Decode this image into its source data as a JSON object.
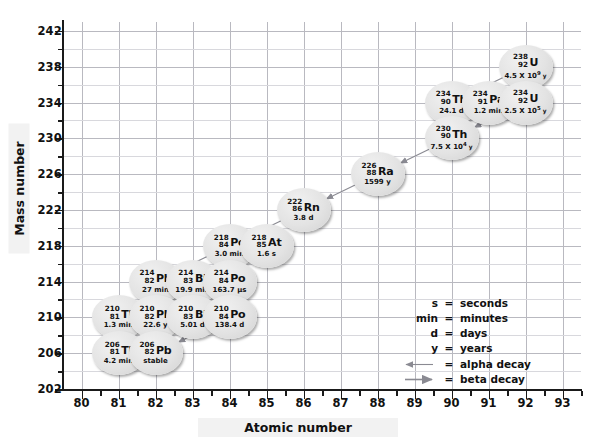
{
  "chart_data": {
    "type": "scatter",
    "title": "",
    "xlabel": "Atomic number",
    "ylabel": "Mass number",
    "xlim": [
      79.5,
      93.5
    ],
    "ylim": [
      202,
      243
    ],
    "x_ticks": [
      80,
      81,
      82,
      83,
      84,
      85,
      86,
      87,
      88,
      89,
      90,
      91,
      92,
      93
    ],
    "y_ticks": [
      202,
      206,
      210,
      214,
      218,
      222,
      226,
      230,
      234,
      238,
      242
    ],
    "x_tick_step": 1,
    "y_tick_step": 4,
    "y_minor_step": 2,
    "grid": true,
    "legend_position": "inside-right",
    "nodes": [
      {
        "symbol": "U",
        "mass": "238",
        "z": "92",
        "half_life": "4.5 X 10",
        "exponent": "9",
        "unit": "y",
        "x": 92,
        "y": 238
      },
      {
        "symbol": "Th",
        "mass": "234",
        "z": "90",
        "half_life": "24.1 d",
        "exponent": "",
        "unit": "",
        "x": 90,
        "y": 234
      },
      {
        "symbol": "Pa",
        "mass": "234",
        "z": "91",
        "half_life": "1.2 min",
        "exponent": "",
        "unit": "",
        "x": 91,
        "y": 234
      },
      {
        "symbol": "U",
        "mass": "234",
        "z": "92",
        "half_life": "2.5 X 10",
        "exponent": "5",
        "unit": "y",
        "x": 92,
        "y": 234
      },
      {
        "symbol": "Th",
        "mass": "230",
        "z": "90",
        "half_life": "7.5 X 10",
        "exponent": "4",
        "unit": "y",
        "x": 90,
        "y": 230
      },
      {
        "symbol": "Ra",
        "mass": "226",
        "z": "88",
        "half_life": "1599 y",
        "exponent": "",
        "unit": "",
        "x": 88,
        "y": 226
      },
      {
        "symbol": "Rn",
        "mass": "222",
        "z": "86",
        "half_life": "3.8 d",
        "exponent": "",
        "unit": "",
        "x": 86,
        "y": 222
      },
      {
        "symbol": "Po",
        "mass": "218",
        "z": "84",
        "half_life": "3.0 min",
        "exponent": "",
        "unit": "",
        "x": 84,
        "y": 218
      },
      {
        "symbol": "At",
        "mass": "218",
        "z": "85",
        "half_life": "1.6 s",
        "exponent": "",
        "unit": "",
        "x": 85,
        "y": 218
      },
      {
        "symbol": "Pb",
        "mass": "214",
        "z": "82",
        "half_life": "27 min",
        "exponent": "",
        "unit": "",
        "x": 82,
        "y": 214
      },
      {
        "symbol": "Bi",
        "mass": "214",
        "z": "83",
        "half_life": "19.9 min",
        "exponent": "",
        "unit": "",
        "x": 83,
        "y": 214
      },
      {
        "symbol": "Po",
        "mass": "214",
        "z": "84",
        "half_life": "163.7 µs",
        "exponent": "",
        "unit": "",
        "x": 84,
        "y": 214
      },
      {
        "symbol": "Tl",
        "mass": "210",
        "z": "81",
        "half_life": "1.3 min",
        "exponent": "",
        "unit": "",
        "x": 81,
        "y": 210
      },
      {
        "symbol": "Pb",
        "mass": "210",
        "z": "82",
        "half_life": "22.6 y",
        "exponent": "",
        "unit": "",
        "x": 82,
        "y": 210
      },
      {
        "symbol": "Bi",
        "mass": "210",
        "z": "83",
        "half_life": "5.01 d",
        "exponent": "",
        "unit": "",
        "x": 83,
        "y": 210
      },
      {
        "symbol": "Po",
        "mass": "210",
        "z": "84",
        "half_life": "138.4 d",
        "exponent": "",
        "unit": "",
        "x": 84,
        "y": 210
      },
      {
        "symbol": "Tl",
        "mass": "206",
        "z": "81",
        "half_life": "4.2 min",
        "exponent": "",
        "unit": "",
        "x": 81,
        "y": 206
      },
      {
        "symbol": "Pb",
        "mass": "206",
        "z": "82",
        "half_life": "stable",
        "exponent": "",
        "unit": "",
        "x": 82,
        "y": 206
      }
    ],
    "decays": [
      {
        "from": [
          92,
          238
        ],
        "to": [
          90,
          234
        ],
        "type": "alpha"
      },
      {
        "from": [
          90,
          234
        ],
        "to": [
          91,
          234
        ],
        "type": "beta"
      },
      {
        "from": [
          91,
          234
        ],
        "to": [
          92,
          234
        ],
        "type": "beta"
      },
      {
        "from": [
          92,
          234
        ],
        "to": [
          90,
          230
        ],
        "type": "alpha"
      },
      {
        "from": [
          90,
          230
        ],
        "to": [
          88,
          226
        ],
        "type": "alpha"
      },
      {
        "from": [
          88,
          226
        ],
        "to": [
          86,
          222
        ],
        "type": "alpha"
      },
      {
        "from": [
          86,
          222
        ],
        "to": [
          84,
          218
        ],
        "type": "alpha"
      },
      {
        "from": [
          84,
          218
        ],
        "to": [
          85,
          218
        ],
        "type": "beta"
      },
      {
        "from": [
          84,
          218
        ],
        "to": [
          82,
          214
        ],
        "type": "alpha"
      },
      {
        "from": [
          85,
          218
        ],
        "to": [
          83,
          214
        ],
        "type": "alpha"
      },
      {
        "from": [
          82,
          214
        ],
        "to": [
          83,
          214
        ],
        "type": "beta"
      },
      {
        "from": [
          83,
          214
        ],
        "to": [
          84,
          214
        ],
        "type": "beta"
      },
      {
        "from": [
          83,
          214
        ],
        "to": [
          81,
          210
        ],
        "type": "alpha"
      },
      {
        "from": [
          84,
          214
        ],
        "to": [
          82,
          210
        ],
        "type": "alpha"
      },
      {
        "from": [
          81,
          210
        ],
        "to": [
          82,
          210
        ],
        "type": "beta"
      },
      {
        "from": [
          82,
          210
        ],
        "to": [
          83,
          210
        ],
        "type": "beta"
      },
      {
        "from": [
          83,
          210
        ],
        "to": [
          84,
          210
        ],
        "type": "beta"
      },
      {
        "from": [
          83,
          210
        ],
        "to": [
          81,
          206
        ],
        "type": "alpha"
      },
      {
        "from": [
          84,
          210
        ],
        "to": [
          82,
          206
        ],
        "type": "alpha"
      },
      {
        "from": [
          81,
          206
        ],
        "to": [
          82,
          206
        ],
        "type": "beta"
      }
    ]
  },
  "axes": {
    "y_title": "Mass number",
    "x_title": "Atomic number"
  },
  "legend": {
    "rows": [
      {
        "key": "s",
        "eq": "=",
        "value": "seconds",
        "arrow": ""
      },
      {
        "key": "min",
        "eq": "=",
        "value": "minutes",
        "arrow": ""
      },
      {
        "key": "d",
        "eq": "=",
        "value": "days",
        "arrow": ""
      },
      {
        "key": "y",
        "eq": "=",
        "value": "years",
        "arrow": ""
      },
      {
        "key": "",
        "eq": "=",
        "value": "alpha decay",
        "arrow": "left"
      },
      {
        "key": "",
        "eq": "=",
        "value": "beta decay",
        "arrow": "right"
      }
    ]
  },
  "colors": {
    "grid": "#b9b9c0",
    "grid_minor": "#d8d8dd",
    "axis": "#1a1a1a",
    "node_fill": "#e3e3e3",
    "text": "#111111",
    "arrow": "#8a8a92"
  }
}
